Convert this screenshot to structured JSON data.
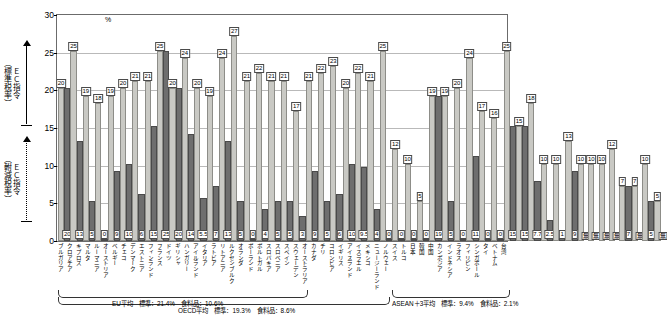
{
  "chart_data": {
    "type": "bar",
    "title": "",
    "xlabel": "",
    "ylabel": "%",
    "ylim": [
      0,
      30
    ],
    "yticks": [
      0,
      5,
      10,
      15,
      20,
      25,
      30
    ],
    "grid": true,
    "legend_position": "none",
    "axis_unit": "%",
    "series": [
      {
        "name": "標準税率",
        "key": "std"
      },
      {
        "name": "軵減税率",
        "key": "red"
      }
    ],
    "categories": [
      "ブルガリア",
      "クロアチア",
      "キプロス",
      "マルタ",
      "ルーマニア",
      "オーストリア",
      "ベルギー",
      "チェコ",
      "デンマーク",
      "エストニア",
      "フィンランド",
      "フランス",
      "ドイツ",
      "ギリシャ",
      "ハンガリー",
      "アイルランド",
      "イタリア",
      "ラトビア",
      "リトアニア",
      "ルクセンブルク",
      "オランダ",
      "ポーランド",
      "ポルトガル",
      "スロバキア",
      "スロベニア",
      "スペイン",
      "スウェーデン",
      "オーストラリア",
      "カナダ",
      "チリ",
      "コロンビア",
      "イギリス",
      "アイスランド",
      "イスラエル",
      "メキシコ",
      "ニュージーランド",
      "ノルウェー",
      "スイス",
      "トルコ",
      "日本",
      "韓国",
      "中国",
      "カンボジア",
      "インドネシア",
      "ラオス",
      "フィリピン",
      "シンガポール",
      "タイ",
      "ベトナム",
      "台湾"
    ],
    "bars": [
      {
        "std": 20,
        "red": 20,
        "std_label": "20",
        "red_label": "20"
      },
      {
        "std": 25,
        "red": 13,
        "std_label": "25",
        "red_label": "13"
      },
      {
        "std": 19,
        "red": 5,
        "std_label": "19",
        "red_label": "5"
      },
      {
        "std": 18,
        "red": 0,
        "std_label": "18",
        "red_label": "0"
      },
      {
        "std": 19,
        "red": 9,
        "std_label": "19",
        "red_label": "9"
      },
      {
        "std": 20,
        "red": 10,
        "std_label": "20",
        "red_label": "10"
      },
      {
        "std": 21,
        "red": 6,
        "std_label": "21",
        "red_label": "6"
      },
      {
        "std": 21,
        "red": 15,
        "std_label": "21",
        "red_label": "15"
      },
      {
        "std": 25,
        "red": 25,
        "std_label": "25",
        "red_label": "25"
      },
      {
        "std": 20,
        "red": 20,
        "std_label": "20",
        "red_label": "20"
      },
      {
        "std": 24,
        "red": 14,
        "std_label": "24",
        "red_label": "14"
      },
      {
        "std": 20,
        "red": 5.5,
        "std_label": "20",
        "red_label": "5.5"
      },
      {
        "std": 19,
        "red": 7,
        "std_label": "19",
        "red_label": "7"
      },
      {
        "std": 24,
        "red": 13,
        "std_label": "24",
        "red_label": "13"
      },
      {
        "std": 27,
        "red": 5,
        "std_label": "27",
        "red_label": "5"
      },
      {
        "std": 21,
        "red": 0,
        "std_label": "21",
        "red_label": "0"
      },
      {
        "std": 22,
        "red": 4,
        "std_label": "22",
        "red_label": "4"
      },
      {
        "std": 21,
        "red": 5,
        "std_label": "21",
        "red_label": "5"
      },
      {
        "std": 21,
        "red": 5,
        "std_label": "21",
        "red_label": "5"
      },
      {
        "std": 17,
        "red": 3,
        "std_label": "17",
        "red_label": "3"
      },
      {
        "std": 21,
        "red": 9,
        "std_label": "21",
        "red_label": "9"
      },
      {
        "std": 22,
        "red": 5,
        "std_label": "22",
        "red_label": "5"
      },
      {
        "std": 23,
        "red": 6,
        "std_label": "23",
        "red_label": "6"
      },
      {
        "std": 20,
        "red": 10,
        "std_label": "20",
        "red_label": "10"
      },
      {
        "std": 22,
        "red": 9.5,
        "std_label": "22",
        "red_label": "9.5"
      },
      {
        "std": 21,
        "red": 4,
        "std_label": "21",
        "red_label": "4"
      },
      {
        "std": 25,
        "red": 0,
        "std_label": "25",
        "red_label": "0"
      },
      {
        "std": 12,
        "red": 0,
        "std_label": "12",
        "red_label": "0"
      },
      {
        "std": 10,
        "red": 0,
        "std_label": "10",
        "red_label": "0"
      },
      {
        "std": 5,
        "red": 0,
        "std_label": "5",
        "red_label": "0"
      },
      {
        "std": 19,
        "red": 19,
        "std_label": "19",
        "red_label": "19"
      },
      {
        "std": 19,
        "red": 5,
        "std_label": "19",
        "red_label": "5"
      },
      {
        "std": 20,
        "red": 0,
        "std_label": "20",
        "red_label": "0"
      },
      {
        "std": 24,
        "red": 11,
        "std_label": "24",
        "red_label": "11"
      },
      {
        "std": 17,
        "red": 0,
        "std_label": "17",
        "red_label": "0"
      },
      {
        "std": 16,
        "red": 0,
        "std_label": "16",
        "red_label": "0"
      },
      {
        "std": 25,
        "red": 15,
        "std_label": "25",
        "red_label": "15"
      },
      {
        "std": 15,
        "red": 15,
        "std_label": "15",
        "red_label": "15"
      },
      {
        "std": 18,
        "red": 7.7,
        "std_label": "18",
        "red_label": "7.7"
      },
      {
        "std": 10,
        "red": 2.5,
        "std_label": "10",
        "red_label": "2.5"
      },
      {
        "std": 10,
        "red": 1,
        "std_label": "10",
        "red_label": "1"
      },
      {
        "std": 13,
        "red": 9,
        "std_label": "13",
        "red_label": "9"
      },
      {
        "std": 10,
        "red": null,
        "std_label": "10",
        "red_label": "無"
      },
      {
        "std": 10,
        "red": null,
        "std_label": "10",
        "red_label": "無"
      },
      {
        "std": 10,
        "red": null,
        "std_label": "10",
        "red_label": "無"
      },
      {
        "std": 12,
        "red": null,
        "std_label": "12",
        "red_label": "無"
      },
      {
        "std": 7,
        "red": 7,
        "std_label": "7",
        "red_label": "7"
      },
      {
        "std": 7,
        "red": null,
        "std_label": "7",
        "red_label": "無"
      },
      {
        "std": 10,
        "red": 5,
        "std_label": "10",
        "red_label": "5"
      },
      {
        "std": 5,
        "red": null,
        "std_label": "5",
        "red_label": "無"
      }
    ]
  },
  "axis": {
    "unit": "%",
    "ticks": [
      "30",
      "25",
      "20",
      "15",
      "10",
      "5",
      "0"
    ],
    "std_note": "（標準税率）",
    "std_note_ec": "ＥＣ指令",
    "red_note": "（軵減税率）",
    "red_note_ec": "ＥＣ指令"
  },
  "footers": {
    "eu": "EU平均　標準：21.4%　食料品：10.6%",
    "oecd": "OECD平均　標準：19.3%　食料品：8.6%",
    "asean": "ASEAN＋3平均　標準：9.4%　食料品：2.1%"
  }
}
